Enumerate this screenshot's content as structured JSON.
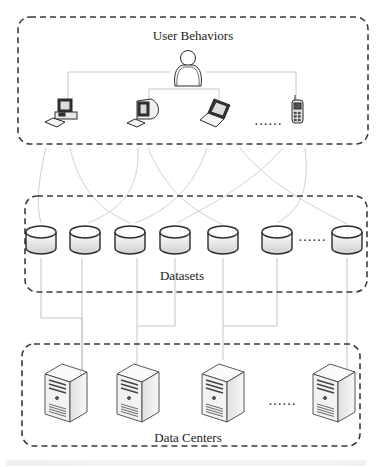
{
  "diagram": {
    "layers": [
      {
        "id": "user-behaviors",
        "label": "User Behaviors",
        "box": {
          "x": 18,
          "y": 17,
          "w": 350,
          "h": 127
        },
        "label_pos": {
          "x": 193,
          "y": 28
        }
      },
      {
        "id": "datasets",
        "label": "Datasets",
        "box": {
          "x": 25,
          "y": 196,
          "w": 342,
          "h": 96
        },
        "label_pos": {
          "x": 182,
          "y": 268
        }
      },
      {
        "id": "data-centers",
        "label": "Data Centers",
        "box": {
          "x": 22,
          "y": 344,
          "w": 338,
          "h": 102
        },
        "label_pos": {
          "x": 188,
          "y": 430
        }
      }
    ],
    "user": {
      "icon": "user-icon",
      "x": 188,
      "y": 65
    },
    "devices": [
      {
        "icon": "desktop-tower-icon",
        "name": "desktop-pc",
        "x": 65,
        "y": 115
      },
      {
        "icon": "crt-monitor-icon",
        "name": "workstation",
        "x": 145,
        "y": 115
      },
      {
        "icon": "laptop-icon",
        "name": "laptop",
        "x": 218,
        "y": 115
      },
      {
        "icon": "mobile-phone-icon",
        "name": "mobile-phone",
        "x": 298,
        "y": 115
      }
    ],
    "device_ellipsis": {
      "text": "……",
      "x": 268,
      "y": 116
    },
    "datasets": [
      {
        "icon": "database-icon",
        "x": 41
      },
      {
        "icon": "database-icon",
        "x": 85
      },
      {
        "icon": "database-icon",
        "x": 130
      },
      {
        "icon": "database-icon",
        "x": 175
      },
      {
        "icon": "database-icon",
        "x": 223
      },
      {
        "icon": "database-icon",
        "x": 277
      },
      {
        "icon": "database-icon",
        "x": 347
      }
    ],
    "dataset_ellipsis": {
      "text": "……",
      "x": 312,
      "y": 232
    },
    "servers": [
      {
        "icon": "server-tower-icon",
        "x": 65
      },
      {
        "icon": "server-tower-icon",
        "x": 137
      },
      {
        "icon": "server-tower-icon",
        "x": 222
      },
      {
        "icon": "server-tower-icon",
        "x": 333
      }
    ],
    "server_ellipsis": {
      "text": "……",
      "x": 282,
      "y": 396
    },
    "colors": {
      "border": "#3a3a3a",
      "connector": "#b8b8b8",
      "icon_stroke": "#2a2a2a",
      "icon_fill_light": "#f2f2f2",
      "icon_fill_shade": "#d4d4d4"
    }
  }
}
